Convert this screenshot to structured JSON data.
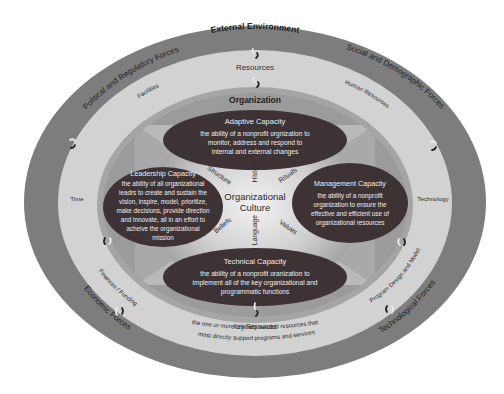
{
  "diagram": {
    "layers": {
      "external": {
        "title": "External Environment",
        "forces": [
          "Political and Regulatory Forces",
          "Social and Demographic Forces",
          "Economic Forces",
          "Technological Forces"
        ]
      },
      "resources": {
        "title": "Resources",
        "items": {
          "facilities": "Facilities",
          "human_resources": "Human Resources",
          "time": "Time",
          "technology": "Technology",
          "finances": "Finances / Funding",
          "program_design": "Program Design and Model"
        },
        "key_resources": {
          "title": "Key Resources",
          "line1": "the one or more critically needed resources that",
          "line2": "most directly support programs and services"
        }
      },
      "organization": {
        "title": "Organization",
        "capacities": {
          "adaptive": {
            "title": "Adaptive Capacity",
            "lines": [
              "the ability of a nonprofit orgnization to",
              "monitor, address and respond to",
              "internal and external changes"
            ]
          },
          "leadership": {
            "title": "Leadership Capacity",
            "lines": [
              "the ability of all organizational",
              "leadrs to create and sustain the",
              "vision, inspire, model, prioritize,",
              "make decisions, provide direction",
              "and innovate, all in an effort to",
              "acheive the organizational",
              "mission"
            ]
          },
          "management": {
            "title": "Management Capacity",
            "lines": [
              "the ability of a nonprofit",
              "organization to ensure the",
              "effective and efficient use of",
              "organizational resources"
            ]
          },
          "technical": {
            "title": "Technical Capacity",
            "lines": [
              "the ability of a nonprofit oranization to",
              "implement all of the key organizational and",
              "programmatic functions"
            ]
          }
        },
        "culture": {
          "title_line1": "Organizational",
          "title_line2": "Culture",
          "elements": {
            "structure": "Structure",
            "history": "History",
            "rituals": "Rituals",
            "beliefs": "Beliefs",
            "language": "Language",
            "values": "Values"
          }
        }
      }
    },
    "colors": {
      "outer_ring": "#7d7d7d",
      "resources_ring": "#d2d2d2",
      "organization_ring": "#a5a5a5",
      "core": "#bcbcbc",
      "capacity_fill": "#3d3335",
      "capacity_text": "#eeeeee",
      "label_text": "#1e1e1e"
    }
  }
}
